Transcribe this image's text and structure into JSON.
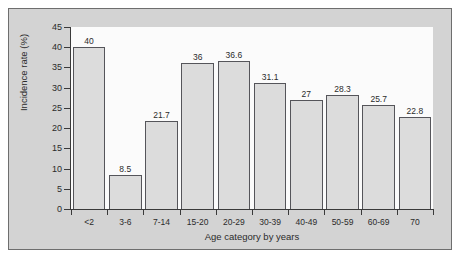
{
  "chart_data": {
    "type": "bar",
    "title": "",
    "xlabel": "Age category by years",
    "ylabel": "Incidence rate (%)",
    "categories": [
      "<2",
      "3-6",
      "7-14",
      "15-20",
      "20-29",
      "30-39",
      "40-49",
      "50-59",
      "60-69",
      "70"
    ],
    "values": [
      40,
      8.5,
      21.7,
      36,
      36.6,
      31.1,
      27,
      28.3,
      25.7,
      22.8
    ],
    "value_labels": [
      "40",
      "8.5",
      "21.7",
      "36",
      "36.6",
      "31.1",
      "27",
      "28.3",
      "25.7",
      "22.8"
    ],
    "ylim": [
      0,
      45
    ],
    "ytick_labels": [
      "0",
      "5",
      "10",
      "15",
      "20",
      "25",
      "30",
      "35",
      "40",
      "45"
    ],
    "yticks": [
      0,
      5,
      10,
      15,
      20,
      25,
      30,
      35,
      40,
      45
    ],
    "grid": false,
    "legend": null,
    "bar_fill_color": "#dcdcdc",
    "bar_edge_color": "#55555a",
    "panel_background_color": "#d3d3d3",
    "plot_background_color": "#fbfbfb",
    "axis_color": "#3a3a3a",
    "text_color": "#2b2b2b"
  }
}
